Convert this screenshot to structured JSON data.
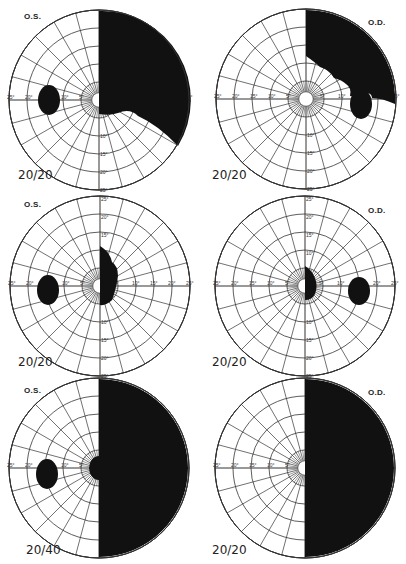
{
  "figure": {
    "ring_degrees": [
      5,
      10,
      15,
      20,
      25
    ],
    "spoke_step_deg": 15,
    "px_per_degree": 3.6,
    "ink_color": "#111111",
    "grid_color": "#333333"
  },
  "panels": [
    {
      "id": "row1-left",
      "eye": "O.S.",
      "acuity": "20/20",
      "center": [
        99,
        100
      ],
      "label_pos": [
        24,
        16
      ],
      "acuity_pos": [
        18,
        174
      ],
      "blind_spot": {
        "cx": 49,
        "cy": 100,
        "rx": 11,
        "ry": 15
      },
      "defect": "upper-right-quadrant-plus",
      "defect_path": "M 99 12 L 99 114 Q 110 116 118 113 Q 130 108 138 116 Q 158 125 178 146 A 89 89 0 0 0 99 11 Z",
      "axis_labels_left": [
        "25°",
        "20°",
        "10°",
        "5°"
      ],
      "axis_labels_down": [
        "10°",
        "15°",
        "20°",
        "25°"
      ]
    },
    {
      "id": "row1-right",
      "eye": "O.D.",
      "acuity": "20/20",
      "center": [
        306,
        99
      ],
      "label_pos": [
        368,
        22
      ],
      "acuity_pos": [
        212,
        174
      ],
      "blind_spot": {
        "cx": 361,
        "cy": 104,
        "rx": 11,
        "ry": 15
      },
      "defect": "upper-right-quadrant-with-notch",
      "defect_path": "M 306 11 L 306 56 Q 316 63 320 67 Q 330 70 334 78 Q 342 80 346 84 Q 352 88 350 96 Q 358 97 362 93 Q 372 92 372 98 L 372 98 Q 382 98 395 104 A 89 89 0 0 0 306 10 Z",
      "axis_labels_left": [
        "25°",
        "20°",
        "15°",
        "10°",
        "5°"
      ],
      "axis_labels_right": [
        "5°",
        "10°",
        "20°"
      ],
      "axis_labels_up": [
        "20°",
        "5°"
      ],
      "axis_labels_down": [
        "5°",
        "10°",
        "15°",
        "20°",
        "25°"
      ]
    },
    {
      "id": "row2-left",
      "eye": "O.S.",
      "acuity": "20/20",
      "center": [
        100,
        286
      ],
      "label_pos": [
        24,
        204
      ],
      "acuity_pos": [
        18,
        361
      ],
      "blind_spot": {
        "cx": 48,
        "cy": 290,
        "rx": 11,
        "ry": 15
      },
      "defect": "small-central-right-scotoma",
      "defect_path": "M 100 246 Q 110 252 112 262 Q 118 266 118 276 Q 116 290 112 300 Q 106 306 100 305 Z",
      "axis_labels_left": [
        "25°",
        "20°",
        "10°",
        "5°"
      ],
      "axis_labels_right": [
        "5°",
        "10°",
        "15°",
        "20°",
        "25°"
      ],
      "axis_labels_up": [
        "25°",
        "20°",
        "15°"
      ],
      "axis_labels_down": [
        "10°",
        "15°",
        "20°",
        "25°"
      ]
    },
    {
      "id": "row2-right",
      "eye": "O.D.",
      "acuity": "20/20",
      "center": [
        305,
        286
      ],
      "label_pos": [
        368,
        210
      ],
      "acuity_pos": [
        212,
        361
      ],
      "blind_spot": {
        "cx": 359,
        "cy": 291,
        "rx": 11,
        "ry": 14
      },
      "defect": "small-central-right-scotoma",
      "defect_path": "M 305 266 Q 312 270 315 278 Q 318 286 315 294 Q 312 300 305 300 Z",
      "axis_labels_left": [
        "25°",
        "20°",
        "15°",
        "10°",
        "5°"
      ],
      "axis_labels_right": [
        "15°",
        "10°",
        "20°",
        "25°"
      ],
      "axis_labels_up": [
        "25°",
        "20°",
        "15°",
        "10°"
      ],
      "axis_labels_down": [
        "10°",
        "15°",
        "20°",
        "25°"
      ]
    },
    {
      "id": "row3-left",
      "eye": "O.S.",
      "acuity": "20/40",
      "center": [
        99,
        468
      ],
      "label_pos": [
        24,
        390
      ],
      "acuity_pos": [
        26,
        549
      ],
      "blind_spot": {
        "cx": 47,
        "cy": 474,
        "rx": 11,
        "ry": 15
      },
      "defect": "right-homonymous-hemianopia-with-macular-involvement",
      "defect_path": "M 99 379 L 99 456 A 10 12 0 0 0 99 480 L 99 557 A 89 89 0 0 0 99 379 Z",
      "axis_labels_left": [
        "25°",
        "20°",
        "10°",
        "5°"
      ]
    },
    {
      "id": "row3-right",
      "eye": "O.D.",
      "acuity": "20/20",
      "center": [
        305,
        468
      ],
      "label_pos": [
        368,
        392
      ],
      "acuity_pos": [
        212,
        549
      ],
      "blind_spot": null,
      "defect": "right-hemianopia-complete",
      "defect_path": "M 305 379 L 305 557 A 89 89 0 0 0 305 379 Z",
      "axis_labels_left": [
        "25°",
        "20°",
        "15°",
        "10°",
        "5°"
      ]
    }
  ]
}
